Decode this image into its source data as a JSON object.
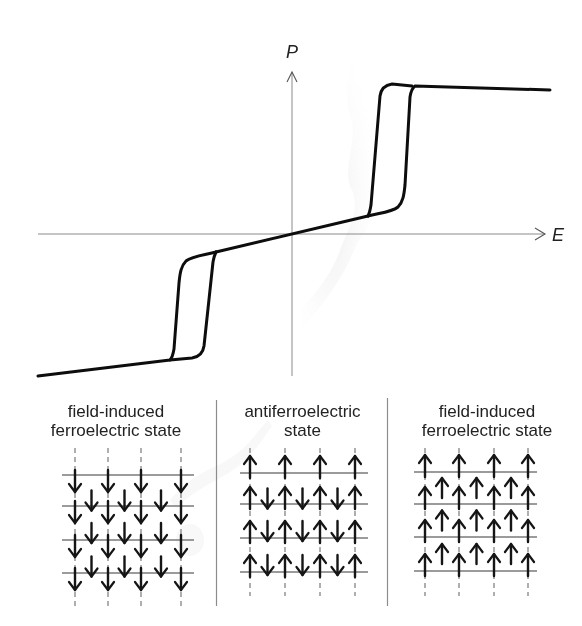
{
  "figure": {
    "type": "antiferroelectric double hysteresis loop with domain schematics",
    "axes": {
      "y_label": "P",
      "x_label": "E"
    },
    "panels": [
      {
        "id": "left",
        "title_line1": "field-induced",
        "title_line2": "ferroelectric state",
        "dipole_pattern": "all-down",
        "lattice_rows": 4,
        "lattice_cols": 4
      },
      {
        "id": "center",
        "title_line1": "antiferroelectric",
        "title_line2": "state",
        "dipole_pattern": "antiparallel: corner sites up, body-center sites down",
        "lattice_rows": 4,
        "lattice_cols": 4
      },
      {
        "id": "right",
        "title_line1": "field-induced",
        "title_line2": "ferroelectric state",
        "dipole_pattern": "all-up",
        "lattice_rows": 4,
        "lattice_cols": 4
      }
    ],
    "colors": {
      "curve": "#0d0d0d",
      "axis": "#8a8a8a",
      "lattice_line": "#7a7a7a",
      "arrow": "#151515",
      "divider": "#8c8c8c",
      "background": "#ffffff"
    }
  },
  "chart_data": {
    "type": "line",
    "title": "",
    "xlabel": "E",
    "ylabel": "P",
    "grid": false,
    "series": [
      {
        "name": "upper loop (increasing E)",
        "points_px": [
          [
            292,
            234
          ],
          [
            368,
            216
          ],
          [
            395,
            211
          ],
          [
            403,
            198
          ],
          [
            407,
            95
          ],
          [
            412,
            85
          ],
          [
            550,
            90
          ]
        ]
      },
      {
        "name": "upper loop (decreasing E)",
        "points_px": [
          [
            550,
            90
          ],
          [
            412,
            85
          ],
          [
            390,
            83
          ],
          [
            381,
            92
          ],
          [
            369,
            212
          ],
          [
            368,
            216
          ]
        ]
      },
      {
        "name": "lower loop (decreasing E)",
        "points_px": [
          [
            292,
            234
          ],
          [
            216,
            252
          ],
          [
            189,
            257
          ],
          [
            181,
            270
          ],
          [
            177,
            373
          ],
          [
            172,
            359
          ],
          [
            38,
            376
          ]
        ]
      },
      {
        "name": "lower loop (increasing E)",
        "points_px": [
          [
            38,
            376
          ],
          [
            172,
            359
          ],
          [
            194,
            357
          ],
          [
            203,
            346
          ],
          [
            215,
            256
          ],
          [
            216,
            252
          ]
        ]
      }
    ]
  }
}
